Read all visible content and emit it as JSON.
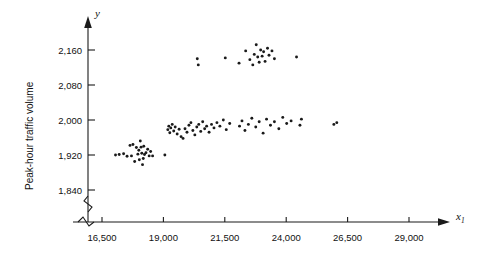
{
  "chart_data": {
    "type": "scatter",
    "title": "",
    "xlabel": "x1",
    "ylabel": "Peak-hour traffic volume",
    "y_axis_symbol": "y",
    "x_axis_symbol": "x",
    "x_axis_subscript": "1",
    "xticks": [
      "16,500",
      "19,000",
      "21,500",
      "24,000",
      "26,500",
      "29,000"
    ],
    "xtick_values": [
      16500,
      19000,
      21500,
      24000,
      26500,
      29000
    ],
    "yticks": [
      "1,840",
      "1,920",
      "2,000",
      "2,080",
      "2,160"
    ],
    "ytick_values": [
      1840,
      1920,
      2000,
      2080,
      2160
    ],
    "xlim": [
      15800,
      30200
    ],
    "ylim": [
      1810,
      2200
    ],
    "grid": false,
    "legend": null,
    "axis_break_x": true,
    "axis_break_y": true,
    "marker": "filled-circle",
    "marker_color": "#1a1a1a",
    "points": [
      [
        17050,
        1920
      ],
      [
        17200,
        1921
      ],
      [
        17380,
        1923
      ],
      [
        17520,
        1917
      ],
      [
        17640,
        1942
      ],
      [
        17700,
        1918
      ],
      [
        17760,
        1944
      ],
      [
        17830,
        1905
      ],
      [
        17900,
        1937
      ],
      [
        17960,
        1922
      ],
      [
        18000,
        1931
      ],
      [
        18020,
        1909
      ],
      [
        18060,
        1952
      ],
      [
        18090,
        1938
      ],
      [
        18120,
        1924
      ],
      [
        18150,
        1898
      ],
      [
        18180,
        1912
      ],
      [
        18200,
        1940
      ],
      [
        18230,
        1921
      ],
      [
        18290,
        1925
      ],
      [
        18360,
        1933
      ],
      [
        18420,
        1918
      ],
      [
        18480,
        1928
      ],
      [
        18560,
        1918
      ],
      [
        19060,
        1920
      ],
      [
        19180,
        1978
      ],
      [
        19220,
        1986
      ],
      [
        19260,
        1971
      ],
      [
        19300,
        1982
      ],
      [
        19360,
        1990
      ],
      [
        19420,
        1975
      ],
      [
        19480,
        1984
      ],
      [
        19560,
        1968
      ],
      [
        19640,
        1979
      ],
      [
        19720,
        1962
      ],
      [
        19800,
        1958
      ],
      [
        19880,
        1980
      ],
      [
        19960,
        1972
      ],
      [
        20040,
        1988
      ],
      [
        20120,
        1994
      ],
      [
        20200,
        1976
      ],
      [
        20280,
        1966
      ],
      [
        20360,
        1984
      ],
      [
        20440,
        1990
      ],
      [
        20520,
        1974
      ],
      [
        20600,
        1996
      ],
      [
        20680,
        1980
      ],
      [
        20760,
        1986
      ],
      [
        20860,
        1972
      ],
      [
        20960,
        1990
      ],
      [
        21060,
        1982
      ],
      [
        21180,
        1994
      ],
      [
        21300,
        1986
      ],
      [
        21440,
        2000
      ],
      [
        21560,
        1978
      ],
      [
        21700,
        1992
      ],
      [
        22100,
        1986
      ],
      [
        22200,
        1998
      ],
      [
        22320,
        1976
      ],
      [
        22460,
        1990
      ],
      [
        22600,
        2004
      ],
      [
        22760,
        1984
      ],
      [
        22900,
        1996
      ],
      [
        23060,
        1970
      ],
      [
        23200,
        2002
      ],
      [
        23360,
        1988
      ],
      [
        23520,
        1996
      ],
      [
        23700,
        1980
      ],
      [
        23860,
        2006
      ],
      [
        24020,
        1992
      ],
      [
        24200,
        1998
      ],
      [
        24560,
        1988
      ],
      [
        24620,
        2002
      ],
      [
        25940,
        1990
      ],
      [
        26060,
        1994
      ],
      [
        20380,
        2140
      ],
      [
        20420,
        2126
      ],
      [
        21520,
        2142
      ],
      [
        22080,
        2130
      ],
      [
        22350,
        2158
      ],
      [
        22520,
        2138
      ],
      [
        22640,
        2126
      ],
      [
        22700,
        2150
      ],
      [
        22780,
        2172
      ],
      [
        22840,
        2144
      ],
      [
        22900,
        2132
      ],
      [
        22960,
        2160
      ],
      [
        23020,
        2146
      ],
      [
        23080,
        2156
      ],
      [
        23140,
        2134
      ],
      [
        23240,
        2164
      ],
      [
        23300,
        2148
      ],
      [
        23420,
        2158
      ],
      [
        23520,
        2140
      ],
      [
        24420,
        2144
      ]
    ]
  }
}
